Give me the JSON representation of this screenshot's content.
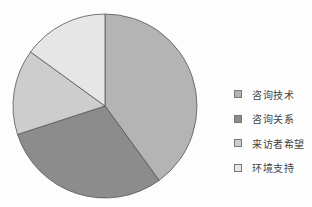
{
  "chart_data": {
    "type": "pie",
    "title": "",
    "categories": [
      "咨询技术",
      "咨询关系",
      "来访者希望",
      "环境支持"
    ],
    "values": [
      40,
      30,
      15,
      15
    ],
    "colors": [
      "#b4b4b4",
      "#8c8c8c",
      "#cdcdcd",
      "#e6e6e6"
    ],
    "start_angle": "12 o'clock",
    "direction": "clockwise",
    "legend_position": "right"
  },
  "legend": {
    "items": [
      {
        "label": "咨询技术",
        "color": "#b4b4b4"
      },
      {
        "label": "咨询关系",
        "color": "#8c8c8c"
      },
      {
        "label": "来访者希望",
        "color": "#cdcdcd"
      },
      {
        "label": "环境支持",
        "color": "#e6e6e6"
      }
    ]
  }
}
